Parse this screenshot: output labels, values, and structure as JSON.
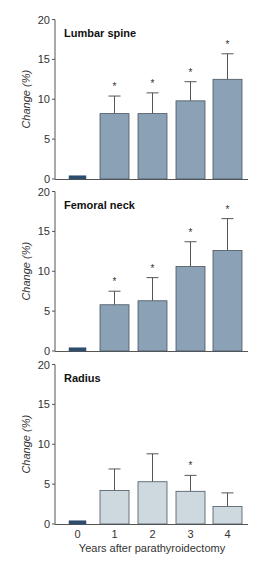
{
  "colors": {
    "baseline_bar": "#2e4d6e",
    "bar_fill_dark": "#8ba1b5",
    "bar_fill_light": "#cdd8df",
    "bar_edge": "#4a5560",
    "axis": "#555555",
    "text": "#333333"
  },
  "chart_data": [
    {
      "type": "bar",
      "title": "Lumbar spine",
      "xlabel": "",
      "ylabel": "Change (%)",
      "ylim": [
        0,
        20
      ],
      "yticks": [
        0,
        5,
        10,
        15,
        20
      ],
      "categories": [
        "0",
        "1",
        "2",
        "3",
        "4"
      ],
      "values": [
        0.4,
        8.2,
        8.2,
        9.8,
        12.5
      ],
      "error_upper": [
        null,
        10.4,
        10.8,
        12.2,
        15.7
      ],
      "significance": [
        false,
        true,
        true,
        true,
        true
      ],
      "fill": "dark"
    },
    {
      "type": "bar",
      "title": "Femoral neck",
      "xlabel": "",
      "ylabel": "Change (%)",
      "ylim": [
        0,
        20
      ],
      "yticks": [
        0,
        5,
        10,
        15,
        20
      ],
      "categories": [
        "0",
        "1",
        "2",
        "3",
        "4"
      ],
      "values": [
        0.4,
        5.8,
        6.3,
        10.6,
        12.6
      ],
      "error_upper": [
        null,
        7.5,
        9.2,
        13.7,
        16.6
      ],
      "significance": [
        false,
        true,
        true,
        true,
        true
      ],
      "fill": "dark"
    },
    {
      "type": "bar",
      "title": "Radius",
      "xlabel": "Years after parathyroidectomy",
      "ylabel": "Change (%)",
      "ylim": [
        0,
        20
      ],
      "yticks": [
        0,
        5,
        10,
        15,
        20
      ],
      "categories": [
        "0",
        "1",
        "2",
        "3",
        "4"
      ],
      "values": [
        0.4,
        4.2,
        5.3,
        4.1,
        2.2
      ],
      "error_upper": [
        null,
        6.9,
        8.8,
        6.1,
        3.9
      ],
      "significance": [
        false,
        false,
        false,
        true,
        false
      ],
      "fill": "light"
    }
  ]
}
